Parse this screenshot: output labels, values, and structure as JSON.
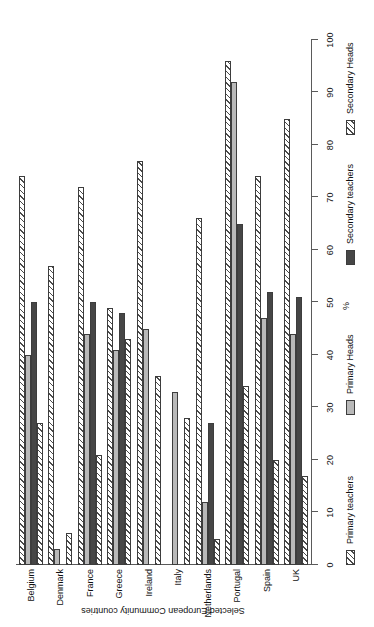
{
  "chart_data": {
    "type": "bar",
    "orientation": "horizontal-rotated",
    "title": "",
    "xlabel": "Selected European Community countries",
    "ylabel": "%",
    "ylim": [
      0,
      100
    ],
    "ytick_labels": [
      "0",
      "10",
      "20",
      "30",
      "40",
      "50",
      "60",
      "70",
      "80",
      "90",
      "100"
    ],
    "ytick_values": [
      0,
      10,
      20,
      30,
      40,
      50,
      60,
      70,
      80,
      90,
      100
    ],
    "grid": false,
    "legend_position": "bottom",
    "categories": [
      "Belgium",
      "Denmark",
      "France",
      "Greece",
      "Ireland",
      "Italy",
      "Netherlands",
      "Portugal",
      "Spain",
      "UK"
    ],
    "series": [
      {
        "name": "Primary teachers",
        "style": "hatched",
        "color": "#ffffff",
        "values": [
          74,
          57,
          72,
          49,
          77,
          null,
          66,
          96,
          74,
          85
        ]
      },
      {
        "name": "Primary Heads",
        "style": "solid-light",
        "color": "#b9b9b9",
        "values": [
          40,
          3,
          44,
          41,
          45,
          33,
          12,
          92,
          47,
          44
        ]
      },
      {
        "name": "Secondary teachers",
        "style": "solid-dark",
        "color": "#464646",
        "values": [
          50,
          null,
          50,
          48,
          null,
          null,
          27,
          65,
          52,
          51
        ]
      },
      {
        "name": "Secondary Heads",
        "style": "hatched",
        "color": "#ffffff",
        "values": [
          27,
          6,
          21,
          43,
          36,
          28,
          5,
          34,
          20,
          17
        ]
      }
    ]
  },
  "legend": {
    "items": [
      {
        "label": "Primary teachers"
      },
      {
        "label": "Primary Heads"
      },
      {
        "label": "Secondary teachers"
      },
      {
        "label": "Secondary Heads"
      }
    ]
  },
  "axes": {
    "value_axis_title": "%",
    "category_axis_title": "Selected European Community countries"
  }
}
